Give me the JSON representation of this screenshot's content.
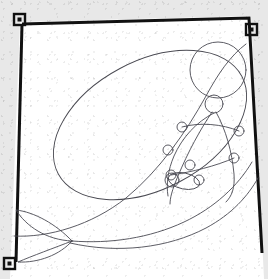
{
  "document": {
    "title": "Scanned line drawing",
    "medium": "pencil line art on white paper",
    "subject": "whale-like creature with jointed armature skeleton",
    "scan_background_color": "#e8e8e8",
    "paper_color": "#ffffff",
    "border_color": "#111111",
    "ink_color": "#4a4a52",
    "border_stroke_width": 3,
    "ink_stroke_width": 0.9
  },
  "frame": {
    "label": "hand-drawn page border",
    "points": "22,24 249,18 262,253 14,262",
    "corner_marks": [
      {
        "name": "corner-mark-top-left",
        "x": 14,
        "y": 14,
        "size": 11
      },
      {
        "name": "corner-mark-top-right",
        "x": 246,
        "y": 24,
        "size": 11
      },
      {
        "name": "corner-mark-bottom-left",
        "x": 4,
        "y": 258,
        "size": 11
      }
    ]
  },
  "drawing": {
    "body_outline": {
      "name": "whale-body-ellipse",
      "cx": 150,
      "cy": 125,
      "rx": 104,
      "ry": 64,
      "rotate": -28
    },
    "head": {
      "name": "head-circle",
      "cx": 218,
      "cy": 70,
      "r": 28
    },
    "neck_joint": {
      "name": "neck-joint-circle",
      "cx": 214,
      "cy": 104,
      "r": 9
    },
    "back_curve": {
      "name": "dorsal-back-curve",
      "path": "M 14 236 C 48 238 92 225 126 198 C 160 170 186 132 206 96 C 218 74 230 56 246 44"
    },
    "belly_curve": {
      "name": "belly-sweep-curve",
      "path": "M 72 241 C 110 244 150 238 184 222 C 214 208 238 186 252 162"
    },
    "lower_sweep": {
      "name": "lower-flank-curve",
      "path": "M 70 243 C 118 254 168 248 206 228 C 232 214 248 196 258 178"
    },
    "tail": {
      "name": "tail-fluke",
      "upper_lobe": "M 72 241 C 56 224 34 212 16 210 C 26 226 46 240 72 241 Z",
      "lower_lobe": "M 72 241 C 54 248 32 256 18 262 C 38 263 60 255 72 241 Z",
      "center_x": 72,
      "center_y": 241
    },
    "armature": {
      "name": "jointed-armature",
      "limb_paths": [
        "M 212 112 C 200 130 188 152 178 176 C 172 190 170 198 170 204",
        "M 216 112 C 226 130 232 152 234 174 C 235 188 232 196 226 202",
        "M 214 113 C 196 122 182 138 174 156 C 168 170 166 184 168 196"
      ],
      "joints": [
        {
          "name": "joint-shoulder-left",
          "cx": 182,
          "cy": 127,
          "r": 5
        },
        {
          "name": "joint-shoulder-right",
          "cx": 239,
          "cy": 131,
          "r": 5
        },
        {
          "name": "joint-elbow-left",
          "cx": 168,
          "cy": 150,
          "r": 5
        },
        {
          "name": "joint-elbow-right",
          "cx": 234,
          "cy": 158,
          "r": 5
        },
        {
          "name": "joint-hip-left",
          "cx": 171,
          "cy": 175,
          "r": 5
        },
        {
          "name": "joint-knee-left",
          "cx": 190,
          "cy": 165,
          "r": 5
        },
        {
          "name": "joint-wrist",
          "cx": 197,
          "cy": 178,
          "r": 4
        }
      ],
      "hand_oval": {
        "name": "hand-oval",
        "cx": 184,
        "cy": 181,
        "rx": 16,
        "ry": 8,
        "rotate": 12
      },
      "hand_tip_circle": {
        "name": "hand-tip-circle",
        "cx": 199,
        "cy": 180,
        "r": 5
      },
      "hand_inner_circle": {
        "name": "hand-inner-circle",
        "cx": 172,
        "cy": 180,
        "r": 7
      }
    }
  }
}
